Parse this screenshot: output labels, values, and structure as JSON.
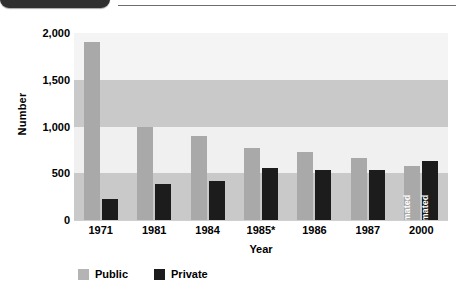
{
  "header": {
    "tab_label": "",
    "rule": "horizontal-rule"
  },
  "chart_data": {
    "type": "bar",
    "title": "",
    "xlabel": "Year",
    "ylabel": "Number",
    "categories": [
      "1971",
      "1981",
      "1984",
      "1985*",
      "1986",
      "1987",
      "2000"
    ],
    "series": [
      {
        "name": "Public",
        "color": "#a9a9a9",
        "values": [
          1900,
          1000,
          900,
          775,
          725,
          665,
          575
        ]
      },
      {
        "name": "Private",
        "color": "#1c1c1c",
        "values": [
          225,
          380,
          420,
          560,
          540,
          540,
          630
        ]
      }
    ],
    "ylim": [
      0,
      2000
    ],
    "yticks": [
      0,
      500,
      1000,
      1500,
      2000
    ],
    "ytick_labels": [
      "0",
      "500",
      "1,000",
      "1,500",
      "2,000"
    ],
    "grid": false,
    "bands": true,
    "legend_position": "bottom-left",
    "annotations": [
      {
        "category": "2000",
        "series": "Public",
        "text": "estimated",
        "orientation": "vertical"
      },
      {
        "category": "2000",
        "series": "Private",
        "text": "estimated",
        "orientation": "vertical"
      }
    ]
  },
  "legend": {
    "items": [
      {
        "label": "Public",
        "color": "#b4b4b4"
      },
      {
        "label": "Private",
        "color": "#1c1c1c"
      }
    ]
  }
}
